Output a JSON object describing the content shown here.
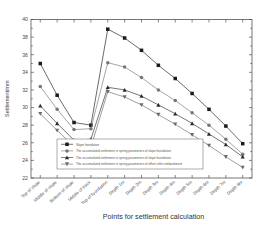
{
  "chart_data": {
    "type": "line",
    "title": "",
    "xlabel": "Points for settlement calculation",
    "ylabel": "Settlement/mm",
    "ylim": [
      22,
      40
    ],
    "yticks": [
      22,
      24,
      26,
      28,
      30,
      32,
      34,
      36,
      38,
      40
    ],
    "grid": false,
    "legend_position": "lower-center-inside",
    "categories": [
      "Top of slope",
      "Middle of slope",
      "Bottom of slope",
      "Middle of track",
      "Top of foundation",
      "Depth 1m",
      "Depth 2m",
      "Depth 3m",
      "Depth 4m",
      "Depth 5m",
      "Depth 6m",
      "Depth 7m",
      "Depth 8m"
    ],
    "series": [
      {
        "name": "Slope foundation",
        "marker": "square",
        "color": "#1a1a1a",
        "values": [
          35.0,
          31.4,
          28.3,
          28.0,
          38.9,
          37.9,
          36.5,
          34.8,
          33.3,
          31.6,
          29.8,
          27.9,
          25.9
        ]
      },
      {
        "name": "The accumulated settlement in spring parameters of slope foundation",
        "marker": "circle",
        "color": "#767676",
        "values": [
          32.4,
          29.8,
          27.5,
          27.6,
          35.1,
          34.6,
          33.4,
          32.0,
          30.8,
          29.4,
          28.0,
          26.4,
          24.7
        ]
      },
      {
        "name": "The accumulated settlement in spring parameters of slope foundation",
        "marker": "triangle-up",
        "color": "#2b2b2b",
        "values": [
          30.2,
          28.2,
          26.3,
          26.4,
          32.3,
          32.0,
          31.3,
          30.3,
          29.3,
          28.2,
          27.0,
          25.8,
          24.4
        ]
      },
      {
        "name": "The accumulated settlement in spring parameters of offset roller embankment",
        "marker": "triangle-down",
        "color": "#6b6b6b",
        "values": [
          29.3,
          27.4,
          25.6,
          25.5,
          31.8,
          31.2,
          30.3,
          29.2,
          28.1,
          26.9,
          25.7,
          24.4,
          23.2
        ]
      }
    ],
    "legend_entries": [
      "Slope foundation",
      "The accumulated settlement in spring parameters of slope foundation",
      "The accumulated settlement in spring parameters of slope foundation",
      "The accumulated settlement in spring parameters of offset roller embankment"
    ]
  }
}
